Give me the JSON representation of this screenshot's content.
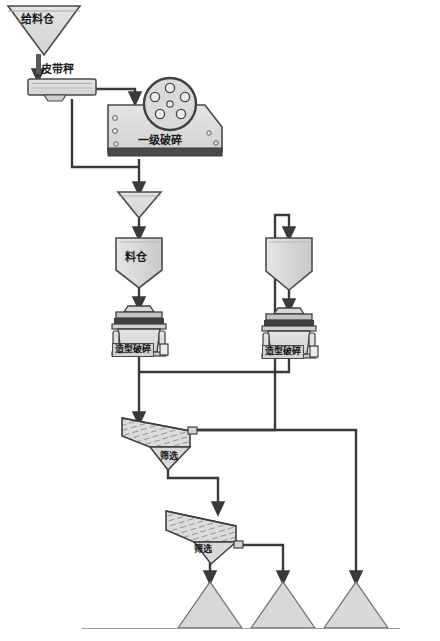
{
  "diagram": {
    "type": "process-flow",
    "colors": {
      "line": "#3a3a3a",
      "fill_light": "#dcdcdc",
      "fill_mid": "#cfcfcf",
      "fill_dark": "#4a4a4a",
      "label_box_fill": "#d2d2d2",
      "text": "#161616",
      "background": "#ffffff"
    },
    "nodes": [
      {
        "id": "feed_bin",
        "label": "给料仓",
        "shape": "inverted-triangle-hopper",
        "x": 47,
        "y": 24
      },
      {
        "id": "belt_scale",
        "label": "皮带秤",
        "shape": "belt-weigher",
        "x": 65,
        "y": 71
      },
      {
        "id": "primary_crusher",
        "label": "一级破碎",
        "shape": "jaw-crusher",
        "x": 170,
        "y": 136
      },
      {
        "id": "funnel",
        "label": "",
        "shape": "funnel",
        "x": 140,
        "y": 205
      },
      {
        "id": "surge_bin_left",
        "label": "料仓",
        "shape": "hopper-bin",
        "x": 139,
        "y": 258
      },
      {
        "id": "shaper_left",
        "label": "造型破碎",
        "shape": "cone-crusher",
        "x": 139,
        "y": 324
      },
      {
        "id": "surge_bin_right",
        "label": "",
        "shape": "hopper-bin",
        "x": 289,
        "y": 261
      },
      {
        "id": "shaper_right",
        "label": "造型破碎",
        "shape": "cone-crusher",
        "x": 289,
        "y": 326
      },
      {
        "id": "screen_1",
        "label": "筛选",
        "shape": "inclined-screen",
        "x": 160,
        "y": 440
      },
      {
        "id": "screen_2",
        "label": "筛选",
        "shape": "inclined-screen",
        "x": 205,
        "y": 533
      },
      {
        "id": "stockpile_1",
        "label": "",
        "shape": "stockpile",
        "x": 210,
        "y": 608
      },
      {
        "id": "stockpile_2",
        "label": "",
        "shape": "stockpile",
        "x": 283,
        "y": 608
      },
      {
        "id": "stockpile_3",
        "label": "",
        "shape": "stockpile",
        "x": 356,
        "y": 608
      }
    ],
    "labels": {
      "feed_bin": "给料仓",
      "belt_scale": "皮带秤",
      "primary_crusher": "一级破碎",
      "surge_bin_left": "料仓",
      "shaper_left": "造型破碎",
      "shaper_right": "造型破碎",
      "screen_1": "筛选",
      "screen_2": "筛选"
    },
    "edges": [
      {
        "from": "feed_bin",
        "to": "belt_scale",
        "type": "arrow"
      },
      {
        "from": "belt_scale",
        "to": "primary_crusher",
        "type": "arrow"
      },
      {
        "from": "belt_scale",
        "to": "funnel",
        "type": "bypass"
      },
      {
        "from": "primary_crusher",
        "to": "funnel",
        "type": "arrow"
      },
      {
        "from": "funnel",
        "to": "surge_bin_left",
        "type": "arrow"
      },
      {
        "from": "surge_bin_left",
        "to": "shaper_left",
        "type": "arrow"
      },
      {
        "from": "surge_bin_right",
        "to": "shaper_right",
        "type": "arrow"
      },
      {
        "from": "shaper_left",
        "to": "screen_1",
        "type": "arrow"
      },
      {
        "from": "shaper_right",
        "to": "screen_1",
        "type": "arrow"
      },
      {
        "from": "screen_1",
        "to": "surge_bin_right",
        "type": "recirculation"
      },
      {
        "from": "screen_1",
        "to": "screen_2",
        "type": "arrow"
      },
      {
        "from": "screen_2",
        "to": "stockpile_1",
        "type": "arrow"
      },
      {
        "from": "screen_2",
        "to": "stockpile_2",
        "type": "arrow"
      },
      {
        "from": "screen_1",
        "to": "stockpile_3",
        "type": "arrow"
      }
    ]
  }
}
